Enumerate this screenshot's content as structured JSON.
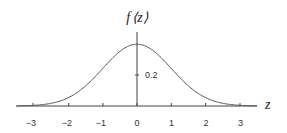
{
  "chart_data": {
    "type": "line",
    "title": "",
    "xlabel": "z",
    "ylabel": "f(z)",
    "xlim": [
      -3.5,
      3.5
    ],
    "ylim": [
      0,
      0.45
    ],
    "grid": false,
    "legend": null,
    "x_ticks": [
      -3,
      -2,
      -1,
      0,
      1,
      2,
      3
    ],
    "x_tick_labels": [
      "−3",
      "−2",
      "−1",
      "0",
      "1",
      "2",
      "3"
    ],
    "y_ticks": [
      0.2
    ],
    "y_tick_labels": [
      "0.2"
    ],
    "series": [
      {
        "name": "standard normal density",
        "x": [
          -3.5,
          -3,
          -2.5,
          -2,
          -1.5,
          -1,
          -0.5,
          0,
          0.5,
          1,
          1.5,
          2,
          2.5,
          3,
          3.5
        ],
        "y": [
          0.0009,
          0.0044,
          0.0175,
          0.054,
          0.1295,
          0.242,
          0.3521,
          0.3989,
          0.3521,
          0.242,
          0.1295,
          0.054,
          0.0175,
          0.0044,
          0.0009
        ]
      }
    ],
    "annotations": []
  },
  "labels": {
    "y_axis_label": "f⟨z⟩",
    "y_axis_label_f": "f",
    "y_axis_label_arg": "⟨z⟩",
    "x_axis_label": "z",
    "tick_neg3": "−3",
    "tick_neg2": "−2",
    "tick_neg1": "−1",
    "tick_0": "0",
    "tick_1": "1",
    "tick_2": "2",
    "tick_3": "3",
    "ytick_02": "0.2"
  },
  "style": {
    "line_color": "#555555",
    "axis_color": "#444444"
  }
}
